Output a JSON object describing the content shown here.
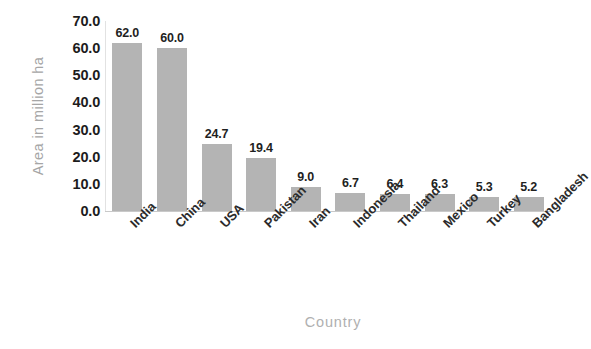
{
  "chart_data": {
    "type": "bar",
    "title": "",
    "xlabel": "Country",
    "ylabel": "Area in million ha",
    "categories": [
      "India",
      "China",
      "USA",
      "Pakistan",
      "Iran",
      "Indonesia",
      "Thailand",
      "Mexico",
      "Turkey",
      "Bangladesh"
    ],
    "values": [
      62.0,
      60.0,
      24.7,
      19.4,
      9.0,
      6.7,
      6.4,
      6.3,
      5.3,
      5.2
    ],
    "value_labels": [
      "62.0",
      "60.0",
      "24.7",
      "19.4",
      "9.0",
      "6.7",
      "6.4",
      "6.3",
      "5.3",
      "5.2"
    ],
    "ylim": [
      0,
      70
    ],
    "ytick_values": [
      70.0,
      60.0,
      50.0,
      40.0,
      30.0,
      20.0,
      10.0,
      0.0
    ],
    "ytick_labels": [
      "70.0",
      "60.0",
      "50.0",
      "40.0",
      "30.0",
      "20.0",
      "10.0",
      "0.0"
    ],
    "grid": false,
    "legend": "none",
    "bar_color": "#b4b4b4",
    "axis_text_color": "#1c1c1c",
    "axis_title_color": "#a6a6a6",
    "background_color": "#ffffff"
  }
}
